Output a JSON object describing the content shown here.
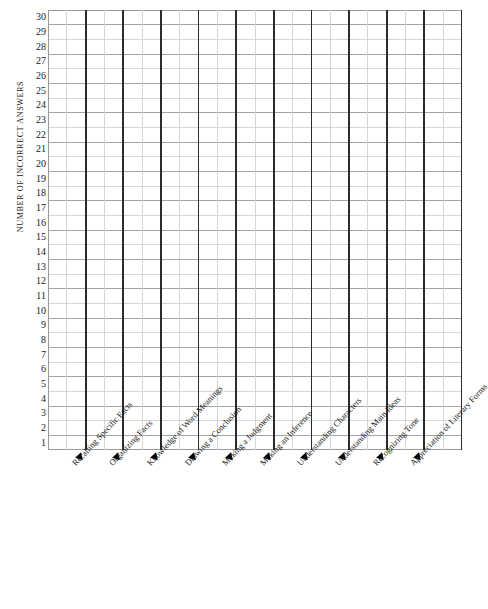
{
  "chart_data": {
    "type": "bar",
    "title": "",
    "subtitle": "",
    "xlabel": "",
    "ylabel": "NUMBER OF INCORRECT ANSWERS",
    "grid": true,
    "legend": "none",
    "note": "Blank plotting grid / tally chart worksheet - no data plotted",
    "ylim": [
      1,
      30
    ],
    "y_ticks": [
      30,
      29,
      28,
      27,
      26,
      25,
      24,
      23,
      22,
      21,
      20,
      19,
      18,
      17,
      16,
      15,
      14,
      13,
      12,
      11,
      10,
      9,
      8,
      7,
      6,
      5,
      4,
      3,
      2,
      1
    ],
    "categories": [
      "Recalling Specific Facts",
      "Organizing Facts",
      "Knowledge of Word Meanings",
      "Drawing a Conclusion",
      "Making a Judgment",
      "Making an Inference",
      "Understanding Characters",
      "Understanding Main Ideas",
      "Recognizing Tone",
      "Appreciation of Literary Forms"
    ],
    "values": [
      0,
      0,
      0,
      0,
      0,
      0,
      0,
      0,
      0,
      0
    ],
    "colors": {
      "background": "#ffffff",
      "major_gridline": "#2b2b2b",
      "minor_gridline": "#9a9a9a",
      "faint_gridline": "#d2d2d2",
      "text": "#1a1a1a",
      "tick_marker": "#000000"
    }
  },
  "axis": {
    "y_title": "NUMBER OF INCORRECT ANSWERS",
    "tick_marker_icon": "triangle-marker"
  }
}
